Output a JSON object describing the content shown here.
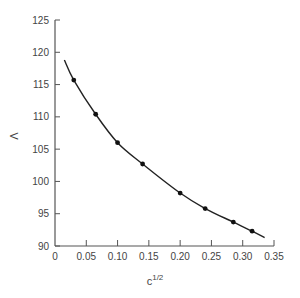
{
  "chart_data": {
    "type": "line",
    "title": "",
    "xlabel": "c^1/2",
    "xlabel_base": "c",
    "xlabel_sup": "1/2",
    "ylabel": "Λ",
    "xlim": [
      0,
      0.35
    ],
    "ylim": [
      90,
      125
    ],
    "x_ticks": [
      0,
      0.05,
      0.1,
      0.15,
      0.2,
      0.25,
      0.3,
      0.35
    ],
    "x_tick_labels": [
      "0",
      "0.05",
      "0.10",
      "0.15",
      "0.20",
      "0.25",
      "0.30",
      "0.35"
    ],
    "y_ticks": [
      90,
      95,
      100,
      105,
      110,
      115,
      120,
      125
    ],
    "y_tick_labels": [
      "90",
      "95",
      "100",
      "105",
      "110",
      "115",
      "120",
      "125"
    ],
    "grid": false,
    "legend": null,
    "series": [
      {
        "name": "measured",
        "style": "points",
        "x": [
          0.03,
          0.065,
          0.1,
          0.14,
          0.2,
          0.24,
          0.285,
          0.315
        ],
        "y": [
          115.7,
          110.4,
          106.0,
          102.7,
          98.2,
          95.8,
          93.7,
          92.3
        ]
      },
      {
        "name": "fit",
        "style": "curve",
        "x": [
          0.015,
          0.03,
          0.065,
          0.1,
          0.14,
          0.2,
          0.24,
          0.285,
          0.315,
          0.335
        ],
        "y": [
          118.8,
          115.7,
          110.4,
          106.0,
          102.7,
          98.2,
          95.8,
          93.7,
          92.3,
          91.3
        ]
      }
    ]
  }
}
